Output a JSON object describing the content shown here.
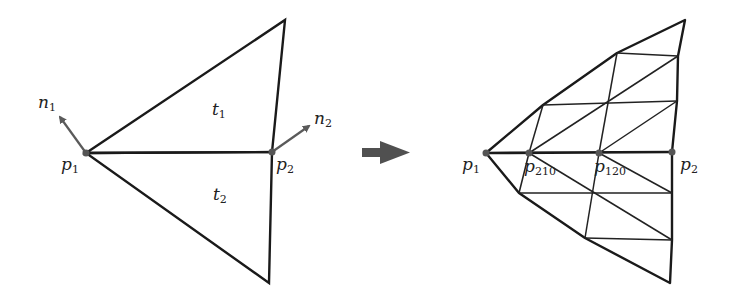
{
  "colors": {
    "stroke": "#1a1a1a",
    "mesh": "#222222",
    "vertex": "#555555",
    "normal": "#5a5a5a",
    "arrow": "#505050",
    "text": "#222222"
  },
  "left_diagram": {
    "triangles": [
      {
        "label_main": "t",
        "label_sub": "1"
      },
      {
        "label_main": "t",
        "label_sub": "2"
      }
    ],
    "points": [
      {
        "label_main": "p",
        "label_sub": "1"
      },
      {
        "label_main": "p",
        "label_sub": "2"
      }
    ],
    "normals": [
      {
        "label_main": "n",
        "label_sub": "1"
      },
      {
        "label_main": "n",
        "label_sub": "2"
      }
    ]
  },
  "transition_arrow": "right-arrow",
  "right_diagram": {
    "points": [
      {
        "label_main": "p",
        "label_sub": "1"
      },
      {
        "label_main": "p",
        "label_sub": "210"
      },
      {
        "label_main": "p",
        "label_sub": "120"
      },
      {
        "label_main": "p",
        "label_sub": "2"
      }
    ]
  }
}
